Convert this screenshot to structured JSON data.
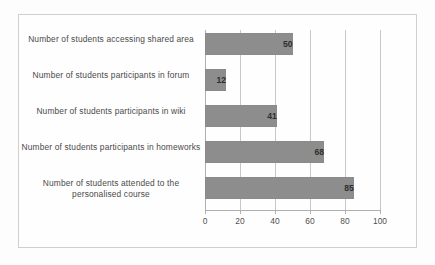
{
  "chart_data": {
    "type": "bar",
    "orientation": "horizontal",
    "title": "",
    "xlabel": "",
    "ylabel": "",
    "xlim": [
      0,
      100
    ],
    "grid": true,
    "legend": false,
    "categories": [
      "Number of students accessing shared area",
      "Number of students participants in forum",
      "Number of students participants in wiki",
      "Number of students participants in homeworks",
      "Number of students attended to the personalised course"
    ],
    "values": [
      50,
      12,
      41,
      68,
      85
    ],
    "data_labels": [
      "50",
      "12",
      "41",
      "68",
      "85"
    ],
    "xticks": [
      0,
      20,
      40,
      60,
      80,
      100
    ],
    "xtick_labels": [
      "0",
      "20",
      "40",
      "60",
      "80",
      "100"
    ],
    "colors": {
      "bar_fill": "#8d8d8d",
      "bar_border": "#8a8a8a",
      "gridline": "#c8c8c8",
      "axis_line": "#b0b0b0",
      "label_text": "#4a4a4a",
      "value_text": "#2f2f2f",
      "frame_border": "#cfcfcf",
      "background": "#fdfdfd"
    }
  }
}
